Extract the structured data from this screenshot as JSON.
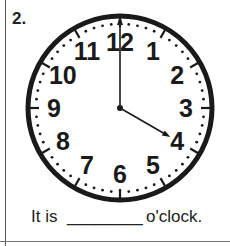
{
  "worksheet": {
    "question_number": "2.",
    "caption": {
      "prefix": "It is",
      "blank": "________",
      "suffix": "o'clock."
    }
  },
  "clock": {
    "numerals": [
      "12",
      "1",
      "2",
      "3",
      "4",
      "5",
      "6",
      "7",
      "8",
      "9",
      "10",
      "11"
    ],
    "hour_hand_points_to": 4,
    "minute_hand_points_to": 12,
    "displayed_time": "4:00",
    "colors": {
      "rim": "#1a1a1a",
      "face": "#ffffff",
      "hands": "#1a1a1a"
    }
  }
}
